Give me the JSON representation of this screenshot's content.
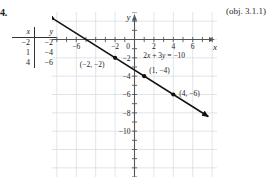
{
  "exercise": {
    "number": "4.",
    "objective": "(obj. 3.1.1)"
  },
  "value_table": {
    "headers": [
      "x",
      "y"
    ],
    "rows": [
      {
        "x": "−2",
        "y": "−2"
      },
      {
        "x": "1",
        "y": "−4"
      },
      {
        "x": "4",
        "y": "−6"
      }
    ]
  },
  "chart_data": {
    "type": "line",
    "title": "",
    "equation": "2x + 3y = −10",
    "equation_parts": {
      "coef_x": "2",
      "var_x": "x",
      "plus": " + ",
      "coef_y": "3",
      "var_y": "y",
      "equals": " = ",
      "rhs": "−10"
    },
    "xlabel": "x",
    "ylabel": "y",
    "xlim": [
      -8.5,
      8.5
    ],
    "ylim": [
      -15,
      3
    ],
    "grid": true,
    "legend": "none",
    "x_tick_labels": [
      "−6",
      "−2",
      "0",
      "2",
      "4",
      "6"
    ],
    "x_tick_values": [
      -6,
      -2,
      0,
      2,
      4,
      6
    ],
    "y_tick_labels": [
      "−2",
      "−4",
      "−6",
      "−8",
      "−10"
    ],
    "y_tick_values": [
      -2,
      -4,
      -6,
      -8,
      -10
    ],
    "points": [
      {
        "x": -2,
        "y": -2,
        "label": "(−2, −2)"
      },
      {
        "x": 1,
        "y": -4,
        "label": "(1, −4)"
      },
      {
        "x": 4,
        "y": -6,
        "label": "(4, −6)"
      }
    ],
    "line": {
      "slope": -0.6666667,
      "intercept": -3.3333333,
      "x_start": -8.2,
      "x_end": 7.6,
      "arrows": "both"
    },
    "colors": {
      "line": "#111111",
      "grid": "#d8dde4",
      "axis": "#555555",
      "point": "#111111"
    }
  }
}
